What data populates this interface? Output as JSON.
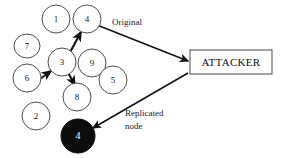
{
  "diagram": {
    "background_color": "#ffffff",
    "stroke_color": "#111111",
    "node_fill_color": "#ffffff",
    "replicated_node_fill_color": "#0d0d0d",
    "nodes": [
      {
        "id": "node-1",
        "label": "1",
        "cx": 56,
        "cy": 19,
        "rx": 14,
        "ry": 14,
        "style": "outline"
      },
      {
        "id": "node-4",
        "label": "4",
        "cx": 87,
        "cy": 19,
        "rx": 14,
        "ry": 14,
        "style": "outline"
      },
      {
        "id": "node-7",
        "label": "7",
        "cx": 27,
        "cy": 46,
        "rx": 13,
        "ry": 12,
        "style": "outline"
      },
      {
        "id": "node-3",
        "label": "3",
        "cx": 62,
        "cy": 62,
        "rx": 14,
        "ry": 14,
        "style": "outline"
      },
      {
        "id": "node-9",
        "label": "9",
        "cx": 92,
        "cy": 63,
        "rx": 14,
        "ry": 14,
        "style": "outline"
      },
      {
        "id": "node-6",
        "label": "6",
        "cx": 27,
        "cy": 78,
        "rx": 14,
        "ry": 14,
        "style": "outline"
      },
      {
        "id": "node-5",
        "label": "5",
        "cx": 113,
        "cy": 80,
        "rx": 14,
        "ry": 14,
        "style": "outline"
      },
      {
        "id": "node-8",
        "label": "8",
        "cx": 77,
        "cy": 97,
        "rx": 14,
        "ry": 14,
        "style": "outline"
      },
      {
        "id": "node-2",
        "label": "2",
        "cx": 36,
        "cy": 116,
        "rx": 14,
        "ry": 14,
        "style": "outline"
      },
      {
        "id": "node-4-replicated",
        "label": "4",
        "cx": 78,
        "cy": 136,
        "rx": 17,
        "ry": 17,
        "style": "filled"
      }
    ],
    "edges": [
      {
        "id": "edge-6-to-3",
        "from": "node-6",
        "to": "node-3",
        "x1": 40,
        "y1": 79,
        "x2": 52,
        "y2": 71
      },
      {
        "id": "edge-3-to-4",
        "from": "node-3",
        "to": "node-4",
        "x1": 68,
        "y1": 55,
        "x2": 81,
        "y2": 31
      },
      {
        "id": "edge-3-to-8",
        "from": "node-3",
        "to": "node-8",
        "x1": 68,
        "y1": 71,
        "x2": 76,
        "y2": 86
      },
      {
        "id": "edge-4-to-attacker",
        "from": "node-4",
        "to": "attacker-box",
        "x1": 97,
        "y1": 25,
        "x2": 188,
        "y2": 61
      },
      {
        "id": "edge-attacker-to-replicated",
        "from": "attacker-box",
        "to": "node-4-replicated",
        "x1": 188,
        "y1": 73,
        "x2": 93,
        "y2": 128
      }
    ],
    "attacker_box": {
      "label": "ATTACKER",
      "x": 190,
      "y": 50,
      "width": 82,
      "height": 24
    },
    "annotations": [
      {
        "id": "annotation-original",
        "text": "Original",
        "x": 112,
        "y": 23
      },
      {
        "id": "annotation-replicated-line1",
        "text": "Replicated",
        "x": 125,
        "y": 114
      },
      {
        "id": "annotation-replicated-line2",
        "text": "node",
        "x": 125,
        "y": 127
      }
    ]
  }
}
